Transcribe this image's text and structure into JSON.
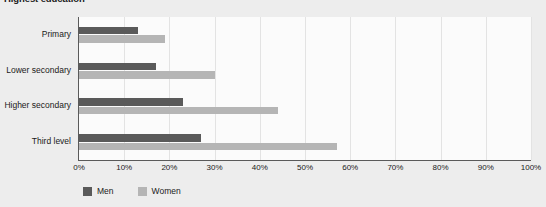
{
  "chart_data": {
    "type": "bar",
    "orientation": "horizontal",
    "title": "Highest education",
    "xlabel": "",
    "ylabel": "",
    "categories": [
      "Primary",
      "Lower secondary",
      "Higher secondary",
      "Third level"
    ],
    "series": [
      {
        "name": "Men",
        "color": "#5a5a5a",
        "values": [
          13,
          17,
          23,
          27
        ]
      },
      {
        "name": "Women",
        "color": "#b5b5b5",
        "values": [
          19,
          30,
          44,
          57
        ]
      }
    ],
    "xlim": [
      0,
      100
    ],
    "xticks": [
      0,
      10,
      20,
      30,
      40,
      50,
      60,
      70,
      80,
      90,
      100
    ],
    "xtick_labels": [
      "0%",
      "10%",
      "20%",
      "30%",
      "40%",
      "50%",
      "60%",
      "70%",
      "80%",
      "90%",
      "100%"
    ],
    "grid": true,
    "legend_position": "bottom-left",
    "value_suffix": "%"
  },
  "style": {
    "page_background": "#ededed",
    "plot_background": "#fbfbfb",
    "axis_color": "#5a5a5a",
    "gridline_color": "#e3e3e3",
    "text_color": "#1a1a1a"
  }
}
